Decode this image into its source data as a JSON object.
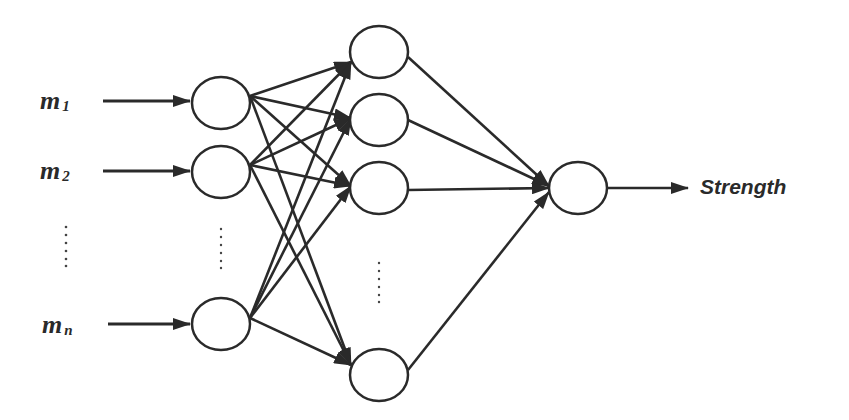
{
  "diagram": {
    "type": "neural-network",
    "inputs": [
      {
        "var": "m",
        "sub": "1"
      },
      {
        "var": "m",
        "sub": "2"
      },
      {
        "var": "m",
        "sub": "n"
      }
    ],
    "ellipsis": "......",
    "output_label": "Strength",
    "layers": {
      "input_nodes": 3,
      "hidden_nodes": 4,
      "output_nodes": 1
    },
    "colors": {
      "stroke": "#2a2a2a",
      "background": "#ffffff"
    }
  }
}
